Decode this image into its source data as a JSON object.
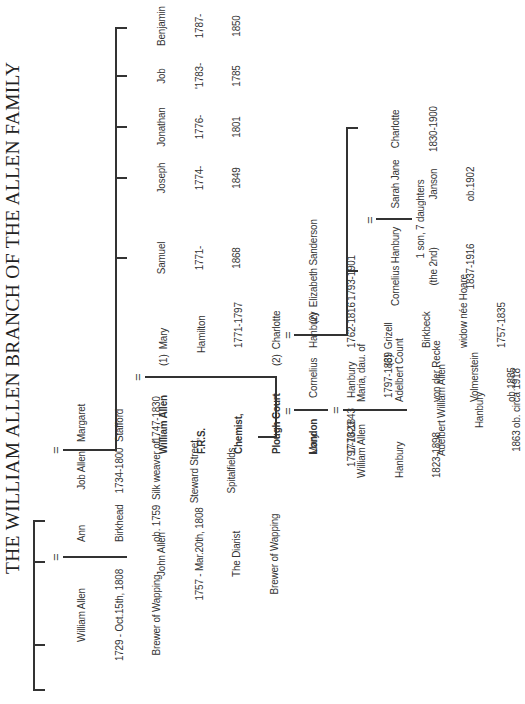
{
  "title": "THE WILLIAM ALLEN BRANCH OF THE ALLEN FAMILY",
  "marriage_symbol": "=",
  "generation1": {
    "william_allen": {
      "name": "William Allen",
      "dates": "1729 - Oct.15th, 1808",
      "note": "Brewer of Wapping"
    },
    "ann_birkhead": {
      "name": "Ann",
      "surname": "Birkhead",
      "dates": "ob. 1759"
    },
    "job_allen": {
      "name": "Job Allen",
      "dates": "1734-1800",
      "note1": "Silk weaver of",
      "note2": "Steward Street,",
      "note3": "Spitalfields"
    },
    "margaret_stafford": {
      "name": "Margaret",
      "surname": "Stafford",
      "dates": "1747-1830"
    }
  },
  "john_allen": {
    "name": "John Allen",
    "dates": "1757 - Mar.20th, 1808",
    "note1": "The Diarist",
    "note2": "Brewer of Wapping"
  },
  "william_allen_frs": {
    "line1": "William Allen",
    "line2": "F.R.S.",
    "line3": "Chemist,",
    "line4": "Plough Court",
    "line5": "London",
    "dates": "1770-1843"
  },
  "wives": [
    {
      "num": "(1)",
      "line1": "Mary",
      "line2": "Hamilton",
      "line3": "1771-1797"
    },
    {
      "num": "(2)",
      "line1": "Charlotte",
      "line2": "Hanbury",
      "line3": "1762-1816"
    },
    {
      "num": "(3)",
      "line1": "Grizell",
      "line2": "Birkbeck",
      "line3": "widow née Hoare",
      "line4": "1757-1835"
    }
  ],
  "siblings": [
    {
      "name": "Samuel",
      "dates1": "1771-",
      "dates2": "1868"
    },
    {
      "name": "Joseph",
      "dates1": "1774-",
      "dates2": "1849"
    },
    {
      "name": "Jonathan",
      "dates1": "1776-",
      "dates2": "1801"
    },
    {
      "name": "Job",
      "dates1": "'1783-",
      "dates2": "1785"
    },
    {
      "name": "Benjamin",
      "dates1": "1787-",
      "dates2": "1850"
    }
  ],
  "mary": {
    "name": "Mary",
    "dates": "1797-1823"
  },
  "cornelius_hanbury": {
    "line1": "Cornelius",
    "line2": "Hanbury",
    "dates": "1797-1869"
  },
  "elizabeth_sanderson": {
    "num": "(2)",
    "name": "Elizabeth Sanderson",
    "dates": "1793-1901"
  },
  "william_allen_hanbury": {
    "line1": "William Allen",
    "line2": "Hanbury",
    "dates": "1823-1898"
  },
  "maria": {
    "line1": "Maria, dau. of",
    "line2": "Adelbert Count",
    "line3": "von der Recke",
    "line4": "Volmerstein",
    "line5": "ob.1885"
  },
  "adelbert": {
    "line1": "Adelbert William Allen",
    "line2": "Hanbury",
    "line3": "1863 ob. circa 1918"
  },
  "cornelius_2nd": {
    "line1": "Cornelius Hanbury",
    "line2": "(the 2nd)",
    "dates": "1837-1916"
  },
  "sarah_jane": {
    "line1": "Sarah Jane",
    "line2": "Janson",
    "line3": "ob.1902"
  },
  "children_note": "1 son, 7 daughters",
  "charlotte": {
    "name": "Charlotte",
    "dates": "1830-1900"
  }
}
